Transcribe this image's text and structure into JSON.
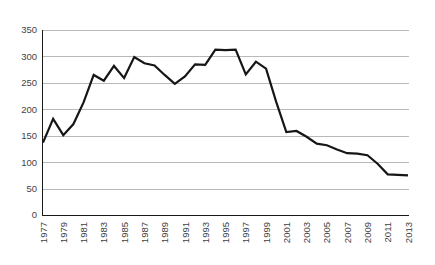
{
  "chart_data": {
    "type": "line",
    "title": "",
    "subtitle": "",
    "xlabel": "",
    "ylabel": "",
    "ylim": [
      0,
      350
    ],
    "ytick_values": [
      0,
      50,
      100,
      150,
      200,
      250,
      300,
      350
    ],
    "ytick_labels": [
      "0",
      "50",
      "100",
      "150",
      "200",
      "250",
      "300",
      "350"
    ],
    "grid": "horizontal",
    "legend": "none",
    "xtick_labels": [
      "1977",
      "1979",
      "1981",
      "1983",
      "1985",
      "1987",
      "1989",
      "1991",
      "1993",
      "1995",
      "1997",
      "1999",
      "2001",
      "2003",
      "2005",
      "2007",
      "2009",
      "2011",
      "2013"
    ],
    "xtick_rotation": 90,
    "x": [
      1977,
      1978,
      1979,
      1980,
      1981,
      1982,
      1983,
      1984,
      1985,
      1986,
      1987,
      1988,
      1989,
      1990,
      1991,
      1992,
      1993,
      1994,
      1995,
      1996,
      1997,
      1998,
      1999,
      2000,
      2001,
      2002,
      2003,
      2004,
      2005,
      2006,
      2007,
      2008,
      2009,
      2010,
      2011,
      2012,
      2013
    ],
    "values": [
      137,
      182,
      151,
      172,
      213,
      265,
      254,
      282,
      259,
      299,
      287,
      283,
      265,
      248,
      262,
      285,
      284,
      313,
      312,
      313,
      266,
      290,
      277,
      214,
      157,
      159,
      148,
      135,
      132,
      124,
      117,
      116,
      113,
      97,
      77,
      76,
      75
    ],
    "series": [
      {
        "name": "series-1",
        "color": "#161616",
        "values": [
          137,
          182,
          151,
          172,
          213,
          265,
          254,
          282,
          259,
          299,
          287,
          283,
          265,
          248,
          262,
          285,
          284,
          313,
          312,
          313,
          266,
          290,
          277,
          214,
          157,
          159,
          148,
          135,
          132,
          124,
          117,
          116,
          113,
          97,
          77,
          76,
          75
        ]
      }
    ]
  },
  "colors": {
    "line": "#161616",
    "grid": "#b9b9b9",
    "axis": "#1a1a1a",
    "text": "#3f3f3f",
    "background": "#ffffff"
  }
}
